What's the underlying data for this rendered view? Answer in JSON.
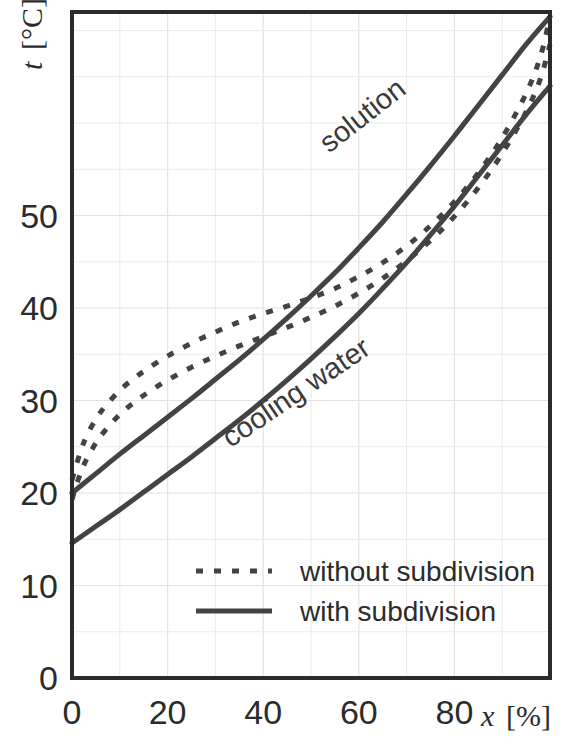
{
  "chart_data": {
    "type": "line",
    "title": "",
    "subtitle": "",
    "xlabel": "x [%]",
    "xlabel_symbol": "x",
    "xlabel_unit": "[%]",
    "ylabel": "t [°C]",
    "ylabel_symbol": "t",
    "ylabel_unit": "[°C]",
    "xlim": [
      0,
      100
    ],
    "ylim": [
      0,
      72
    ],
    "xticks": [
      0,
      20,
      40,
      60,
      80
    ],
    "xtick_labels": [
      "0",
      "20",
      "40",
      "60",
      "80"
    ],
    "yticks": [
      0,
      10,
      20,
      30,
      40,
      50
    ],
    "ytick_labels": [
      "0",
      "10",
      "20",
      "30",
      "40",
      "50"
    ],
    "x_minor_step": 10,
    "y_minor_step": 5,
    "grid": true,
    "grid_color": "#eceaea",
    "legend_position": "bottom-center-inside",
    "line_color": "#434343",
    "annotations": [
      {
        "text": "solution",
        "x": 62,
        "y": 60,
        "rotation": -38
      },
      {
        "text": "cooling water",
        "x": 48,
        "y": 30,
        "rotation": -34
      }
    ],
    "series": [
      {
        "name": "solution, without subdivision",
        "label": "solution",
        "style": "dashed",
        "x": [
          0,
          1,
          2,
          3,
          5,
          7,
          10,
          13,
          16,
          20,
          25,
          30,
          35,
          40,
          45,
          50,
          55,
          60,
          65,
          70,
          75,
          80,
          85,
          90,
          95,
          98,
          100
        ],
        "y": [
          21.4,
          23.2,
          24.8,
          26.1,
          28.0,
          29.4,
          31.1,
          32.4,
          33.5,
          34.8,
          36.2,
          37.4,
          38.5,
          39.4,
          40.2,
          41.1,
          42.1,
          43.4,
          44.9,
          46.7,
          48.9,
          51.5,
          54.6,
          58.4,
          63.2,
          67.2,
          71.5
        ]
      },
      {
        "name": "cooling water, without subdivision",
        "label": "cooling water",
        "style": "dashed",
        "x": [
          0,
          1,
          2,
          3,
          5,
          7,
          10,
          13,
          16,
          20,
          25,
          30,
          35,
          40,
          45,
          50,
          55,
          60,
          65,
          70,
          75,
          80,
          85,
          90,
          95,
          98,
          100
        ],
        "y": [
          19.3,
          21.0,
          22.4,
          23.6,
          25.4,
          26.8,
          28.5,
          29.8,
          30.9,
          32.2,
          33.6,
          34.8,
          35.9,
          36.9,
          37.9,
          39.0,
          40.2,
          41.6,
          43.2,
          45.1,
          47.3,
          49.9,
          53.0,
          56.7,
          61.2,
          64.8,
          68.5
        ]
      },
      {
        "name": "solution, with subdivision",
        "label": "solution",
        "style": "solid",
        "x": [
          0,
          5,
          10,
          15,
          20,
          25,
          30,
          35,
          40,
          45,
          50,
          55,
          60,
          65,
          70,
          75,
          80,
          85,
          90,
          95,
          100
        ],
        "y": [
          20.0,
          22.1,
          24.2,
          26.2,
          28.2,
          30.2,
          32.3,
          34.4,
          36.6,
          38.9,
          41.3,
          43.8,
          46.5,
          49.3,
          52.3,
          55.4,
          58.6,
          61.9,
          65.2,
          68.5,
          71.5
        ]
      },
      {
        "name": "cooling water, with subdivision",
        "label": "cooling water",
        "style": "solid",
        "x": [
          0,
          5,
          10,
          15,
          20,
          25,
          30,
          35,
          40,
          45,
          50,
          55,
          60,
          65,
          70,
          75,
          80,
          85,
          90,
          95,
          100
        ],
        "y": [
          14.6,
          16.4,
          18.2,
          20.1,
          22.0,
          23.9,
          25.9,
          27.9,
          30.0,
          32.2,
          34.5,
          36.9,
          39.4,
          42.1,
          44.9,
          47.9,
          51.0,
          54.3,
          57.6,
          60.9,
          64.0
        ]
      }
    ]
  },
  "legend": {
    "items": [
      {
        "label": "without subdivision",
        "style": "dashed"
      },
      {
        "label": "with subdivision",
        "style": "solid"
      }
    ]
  }
}
